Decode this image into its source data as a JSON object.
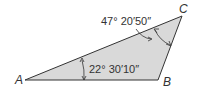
{
  "diagram": {
    "type": "triangle",
    "fill_color": "#d9d9d9",
    "stroke_color": "#333333",
    "vertices": {
      "A": {
        "label": "A"
      },
      "B": {
        "label": "B"
      },
      "C": {
        "label": "C"
      }
    },
    "angles": {
      "A": {
        "label": "22° 30′10″"
      },
      "C": {
        "label": "47° 20′50″"
      }
    }
  }
}
